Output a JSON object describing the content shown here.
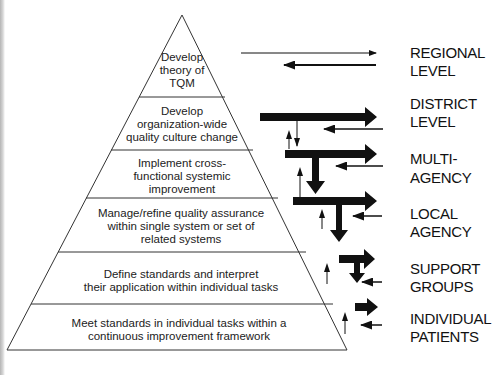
{
  "diagram": {
    "tiers": [
      {
        "lines": [
          "Develop",
          "theory of",
          "TQM"
        ]
      },
      {
        "lines": [
          "Develop",
          "organization-wide",
          "quality culture change"
        ]
      },
      {
        "lines": [
          "Implement cross-",
          "functional systemic",
          "improvement"
        ]
      },
      {
        "lines": [
          "Manage/refine quality assurance",
          "within single system or set of",
          "related systems"
        ]
      },
      {
        "lines": [
          "Define standards and interpret",
          "their application within individual tasks"
        ]
      },
      {
        "lines": [
          "Meet standards in individual tasks within a",
          "continuous improvement framework"
        ]
      }
    ],
    "levels": [
      {
        "lines": [
          "REGIONAL",
          "LEVEL"
        ]
      },
      {
        "lines": [
          "DISTRICT",
          "LEVEL"
        ]
      },
      {
        "lines": [
          "MULTI-",
          "AGENCY"
        ]
      },
      {
        "lines": [
          "LOCAL",
          "AGENCY"
        ]
      },
      {
        "lines": [
          "SUPPORT",
          "GROUPS"
        ]
      },
      {
        "lines": [
          "INDIVIDUAL",
          "PATIENTS"
        ]
      }
    ],
    "colors": {
      "stroke": "#222222",
      "arrow": "#111111",
      "background": "#ffffff"
    }
  }
}
